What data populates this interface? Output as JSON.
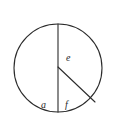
{
  "figure": {
    "type": "geometry-diagram",
    "background_color": "#ffffff",
    "stroke_color": "#2b2b2b",
    "stroke_width": 1.1,
    "circle": {
      "name": "circle-outline",
      "center_x": 58,
      "center_y": 68,
      "radius": 44
    },
    "segments": [
      {
        "name": "vertical-diameter",
        "x1": 58,
        "y1": 24,
        "x2": 58,
        "y2": 112,
        "label": "chord-diameter"
      },
      {
        "name": "radius-to-arc",
        "x1": 58,
        "y1": 67,
        "x2": 95,
        "y2": 102,
        "label": "radius"
      }
    ],
    "labels": [
      {
        "id": "label-e",
        "text": "e",
        "x": 66,
        "y": 53,
        "region": "upper-right-of-diameter"
      },
      {
        "id": "label-a",
        "text": "a",
        "x": 41,
        "y": 100,
        "region": "lower-left-sector"
      },
      {
        "id": "label-f",
        "text": "f",
        "x": 65,
        "y": 100,
        "region": "lower-middle-sector"
      }
    ]
  }
}
